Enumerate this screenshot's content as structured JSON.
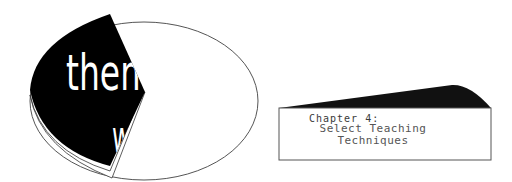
{
  "illustration": {
    "flap_text_top": "them",
    "flap_text_bottom": "w",
    "colors": {
      "flap": "#000000",
      "outline": "#555555",
      "background": "#ffffff"
    }
  },
  "chapter_box": {
    "label": "Chapter 4:",
    "title_line1": "Select Teaching",
    "title_line2": "Techniques",
    "colors": {
      "wedge": "#111111",
      "border": "#555555",
      "text": "#444444"
    }
  }
}
